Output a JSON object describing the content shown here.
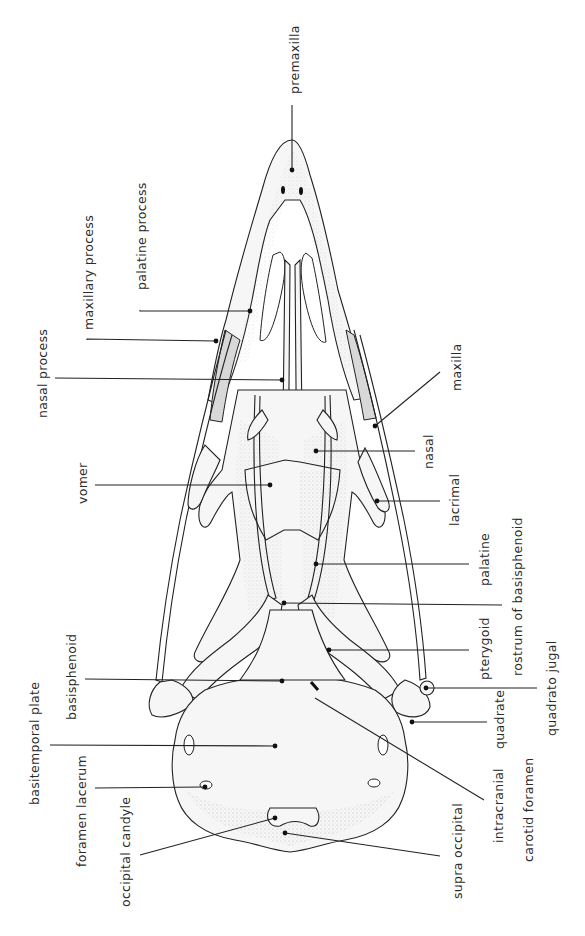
{
  "figure": {
    "labels": {
      "premaxilla": "premaxilla",
      "maxillary_process": "maxillary process",
      "palatine_process": "palatine process",
      "nasal_process": "nasal process",
      "maxilla": "maxilla",
      "nasal": "nasal",
      "vomer": "vomer",
      "lacrimal": "lacrimal",
      "palatine": "palatine",
      "rostrum_of_basisphenoid": "rostrum of basisphenoid",
      "pterygoid": "pterygoid",
      "basisphenoid": "basisphenoid",
      "quadrato_jugal": "quadrato jugal",
      "basitemporal_plate": "basitemporal plate",
      "quadrate": "quadrate",
      "foramen_lacerum": "foramen lacerum",
      "intracranial_carotid_foramen_1": "intracranial",
      "intracranial_carotid_foramen_2": "carotid foramen",
      "occipital_candyle": "occipital candyle",
      "supra_occipital": "supra occipital"
    }
  }
}
